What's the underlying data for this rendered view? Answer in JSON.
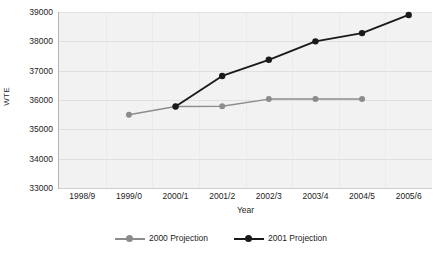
{
  "chart_data": {
    "type": "line",
    "title": "",
    "xlabel": "Year",
    "ylabel": "WTE",
    "categories": [
      "1998/9",
      "1999/0",
      "2000/1",
      "2001/2",
      "2002/3",
      "2003/4",
      "2004/5",
      "2005/6"
    ],
    "ylim": [
      33000,
      39000
    ],
    "yticks": [
      33000,
      34000,
      35000,
      36000,
      37000,
      38000,
      39000
    ],
    "ytick_labels": [
      "33000",
      "34000",
      "35000",
      "36000",
      "37000",
      "38000",
      "39000"
    ],
    "grid": "horizontal",
    "legend_position": "bottom-center",
    "series": [
      {
        "name": "2000 Projection",
        "color": "#8c8c8c",
        "marker": "circle",
        "values": [
          null,
          35500,
          35780,
          35790,
          36030,
          36030,
          36030,
          null
        ]
      },
      {
        "name": "2001 Projection",
        "color": "#1a1a1a",
        "marker": "circle",
        "values": [
          null,
          null,
          35780,
          36820,
          37370,
          38000,
          38280,
          38900
        ]
      }
    ]
  },
  "axes": {
    "y_title": "WTE",
    "x_title": "Year"
  },
  "legend": {
    "items": [
      {
        "label": "2000 Projection",
        "color": "#8c8c8c"
      },
      {
        "label": "2001 Projection",
        "color": "#1a1a1a"
      }
    ]
  },
  "colors": {
    "plot_background": "#f2f2f2",
    "gridline": "#e0e0e0",
    "axis_line": "#b5b5b5",
    "series_2000": "#8c8c8c",
    "series_2001": "#1a1a1a",
    "text": "#1d1d1d"
  }
}
